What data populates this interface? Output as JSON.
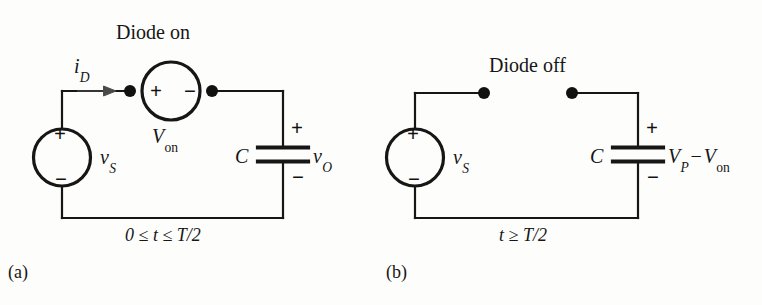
{
  "figure": {
    "type": "circuit-diagram",
    "background_color": "#fdfdfc",
    "line_color": "#161616",
    "panels": [
      {
        "tag": "(a)",
        "title": "Diode on",
        "condition": "0 ≤ t ≤ T/2",
        "elements": {
          "source_label": "v",
          "source_sub": "S",
          "source_plus": "+",
          "source_minus": "−",
          "current_label": "i",
          "current_sub": "D",
          "diode_source_label": "V",
          "diode_source_sub": "on",
          "diode_plus": "+",
          "diode_minus": "−",
          "cap_label": "C",
          "cap_plus": "+",
          "cap_minus": "−",
          "output_label": "v",
          "output_sub": "O"
        }
      },
      {
        "tag": "(b)",
        "title": "Diode off",
        "condition": "t ≥ T/2",
        "elements": {
          "source_label": "v",
          "source_sub": "S",
          "source_plus": "+",
          "source_minus": "−",
          "cap_label": "C",
          "cap_plus": "+",
          "cap_minus": "−",
          "output_v": "V",
          "output_v_sub": "P",
          "output_op": "−",
          "output_v2": "V",
          "output_v2_sub": "on"
        }
      }
    ]
  }
}
